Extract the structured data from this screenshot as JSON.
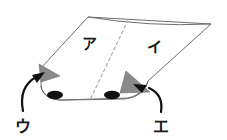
{
  "figure": {
    "background_color": "#ffffff",
    "stroke_color": "#6e6e6e",
    "fold_line_color": "#b0b0b0",
    "flap_fill_color": "#8a8a8a",
    "dot_color": "#111111",
    "arrow_color": "#111111",
    "label_color": "#1a1a1a"
  },
  "labels": {
    "region_left": "ア",
    "region_right": "イ",
    "callout_left": "ウ",
    "callout_right": "エ"
  },
  "parts": {
    "sheet_name": "folded-sheet",
    "fold_line_name": "dashed-fold-line",
    "left_flap_name": "left-gray-flap",
    "right_flap_name": "right-gray-flap",
    "left_dot_name": "left-black-dot",
    "right_dot_name": "right-black-dot",
    "left_arrow_name": "arrow-to-left-flap",
    "right_arrow_name": "arrow-to-right-flap"
  }
}
